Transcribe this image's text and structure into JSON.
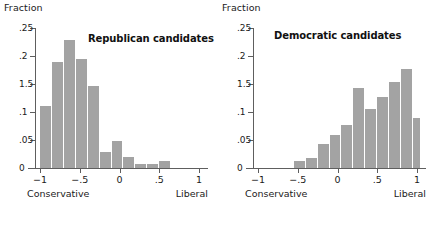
{
  "figure": {
    "background": "#ffffff",
    "bar_color": "#a3a3a3",
    "axis_color": "#5e5e5e"
  },
  "panels": [
    {
      "key": "republican",
      "title": "Republican candidates",
      "ylabel": "Fraction",
      "left_endpoint_label": "Conservative",
      "right_endpoint_label": "Liberal"
    },
    {
      "key": "democratic",
      "title": "Democratic candidates",
      "ylabel": "Fraction",
      "left_endpoint_label": "Conservative",
      "right_endpoint_label": "Liberal"
    }
  ],
  "axes": {
    "yticks": [
      {
        "value": 0.25,
        "label": ".25"
      },
      {
        "value": 0.2,
        "label": ".2"
      },
      {
        "value": 0.15,
        "label": "1.5"
      },
      {
        "value": 0.1,
        "label": ".1"
      },
      {
        "value": 0.05,
        "label": ".05"
      },
      {
        "value": 0,
        "label": "0"
      }
    ],
    "xticks": [
      {
        "value": -1,
        "label": "−1"
      },
      {
        "value": -0.5,
        "label": "−.5"
      },
      {
        "value": 0,
        "label": "0"
      },
      {
        "value": 0.5,
        "label": ".5"
      },
      {
        "value": 1,
        "label": "1"
      }
    ],
    "ylim": [
      0,
      0.25
    ],
    "xlim": [
      -1.05,
      1.05
    ]
  },
  "chart_data": [
    {
      "type": "bar",
      "key": "republican",
      "title": "Republican candidates",
      "xlabel": "",
      "ylabel": "Fraction",
      "xlim": [
        -1.05,
        1.05
      ],
      "ylim": [
        0,
        0.25
      ],
      "grid": false,
      "legend": "none",
      "bin_width": 0.15,
      "annotations": [
        "Conservative",
        "Liberal"
      ],
      "bins": [
        {
          "left": -1.0,
          "right": -0.85,
          "center": -0.925,
          "value": 0.111
        },
        {
          "left": -0.85,
          "right": -0.7,
          "center": -0.775,
          "value": 0.189
        },
        {
          "left": -0.7,
          "right": -0.55,
          "center": -0.625,
          "value": 0.229
        },
        {
          "left": -0.55,
          "right": -0.4,
          "center": -0.475,
          "value": 0.194
        },
        {
          "left": -0.4,
          "right": -0.25,
          "center": -0.325,
          "value": 0.146
        },
        {
          "left": -0.25,
          "right": -0.1,
          "center": -0.175,
          "value": 0.028
        },
        {
          "left": -0.1,
          "right": 0.05,
          "center": -0.025,
          "value": 0.049
        },
        {
          "left": 0.05,
          "right": 0.2,
          "center": 0.125,
          "value": 0.019
        },
        {
          "left": 0.2,
          "right": 0.35,
          "center": 0.275,
          "value": 0.007
        },
        {
          "left": 0.35,
          "right": 0.5,
          "center": 0.425,
          "value": 0.007
        },
        {
          "left": 0.5,
          "right": 0.65,
          "center": 0.575,
          "value": 0.013
        }
      ],
      "categories": [
        "-0.925",
        "-0.775",
        "-0.625",
        "-0.475",
        "-0.325",
        "-0.175",
        "-0.025",
        "0.125",
        "0.275",
        "0.425",
        "0.575"
      ],
      "values": [
        0.111,
        0.189,
        0.229,
        0.194,
        0.146,
        0.028,
        0.049,
        0.019,
        0.007,
        0.007,
        0.013
      ]
    },
    {
      "type": "bar",
      "key": "democratic",
      "title": "Democratic candidates",
      "xlabel": "",
      "ylabel": "Fraction",
      "xlim": [
        -1.05,
        1.05
      ],
      "ylim": [
        0,
        0.25
      ],
      "grid": false,
      "legend": "none",
      "bin_width": 0.15,
      "annotations": [
        "Conservative",
        "Liberal"
      ],
      "bins": [
        {
          "left": -0.55,
          "right": -0.4,
          "center": -0.475,
          "value": 0.012
        },
        {
          "left": -0.4,
          "right": -0.25,
          "center": -0.325,
          "value": 0.018
        },
        {
          "left": -0.25,
          "right": -0.1,
          "center": -0.175,
          "value": 0.042
        },
        {
          "left": -0.1,
          "right": 0.05,
          "center": -0.025,
          "value": 0.059
        },
        {
          "left": 0.05,
          "right": 0.2,
          "center": 0.125,
          "value": 0.077
        },
        {
          "left": 0.2,
          "right": 0.35,
          "center": 0.275,
          "value": 0.142
        },
        {
          "left": 0.35,
          "right": 0.5,
          "center": 0.425,
          "value": 0.106
        },
        {
          "left": 0.5,
          "right": 0.65,
          "center": 0.575,
          "value": 0.126
        },
        {
          "left": 0.65,
          "right": 0.8,
          "center": 0.725,
          "value": 0.153
        },
        {
          "left": 0.8,
          "right": 0.95,
          "center": 0.875,
          "value": 0.176
        },
        {
          "left": 0.95,
          "right": 1.1,
          "center": 1.025,
          "value": 0.089
        }
      ],
      "categories": [
        "-0.475",
        "-0.325",
        "-0.175",
        "-0.025",
        "0.125",
        "0.275",
        "0.425",
        "0.575",
        "0.725",
        "0.875",
        "1.025"
      ],
      "values": [
        0.012,
        0.018,
        0.042,
        0.059,
        0.077,
        0.142,
        0.106,
        0.126,
        0.153,
        0.176,
        0.089
      ]
    }
  ]
}
